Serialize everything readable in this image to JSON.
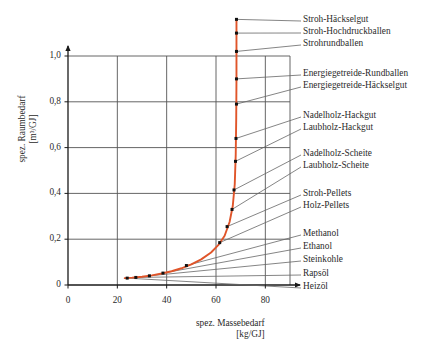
{
  "chart_data": {
    "type": "line",
    "title": "",
    "xlabel": "spez. Massebedarf",
    "xunit": "[kg/GJ]",
    "ylabel": "spez. Raumbedarf",
    "yunit": "[m³/GJ]",
    "xlim": [
      0,
      90
    ],
    "ylim": [
      0,
      1.0
    ],
    "xticks": [
      "0",
      "20",
      "40",
      "60",
      "80"
    ],
    "xtick_values": [
      0,
      20,
      40,
      60,
      80
    ],
    "yticks": [
      "0",
      "0,2",
      "0,4",
      "0,6",
      "0,8",
      "1,0"
    ],
    "ytick_values": [
      0,
      0.2,
      0.4,
      0.6,
      0.8,
      1.0
    ],
    "grid": true,
    "legend_position": "right-annotations",
    "series": [
      {
        "name": "Brennstoffkurve",
        "color": "#E0552A",
        "x": [
          23.0,
          26.0,
          30.0,
          34.0,
          38.0,
          42.0,
          46.0,
          50.0,
          54.0,
          58.0,
          61.0,
          63.5,
          65.5,
          66.8,
          67.6,
          68.0,
          68.2,
          68.3,
          68.3,
          68.3
        ],
        "y": [
          0.03,
          0.032,
          0.036,
          0.042,
          0.05,
          0.06,
          0.073,
          0.09,
          0.112,
          0.142,
          0.175,
          0.215,
          0.275,
          0.345,
          0.44,
          0.57,
          0.73,
          0.9,
          1.06,
          1.16
        ]
      }
    ],
    "data_points": [
      {
        "label": "Heizöl",
        "x": 24.0,
        "y": 0.03
      },
      {
        "label": "Rapsöl",
        "x": 27.5,
        "y": 0.033
      },
      {
        "label": "Steinkohle",
        "x": 33.0,
        "y": 0.04
      },
      {
        "label": "Ethanol",
        "x": 38.5,
        "y": 0.052
      },
      {
        "label": "Methanol",
        "x": 48.0,
        "y": 0.085
      },
      {
        "label": "Holz-Pellets",
        "x": 61.5,
        "y": 0.185
      },
      {
        "label": "Stroh-Pellets",
        "x": 64.5,
        "y": 0.255
      },
      {
        "label": "Laubholz-Scheite",
        "x": 66.5,
        "y": 0.33
      },
      {
        "label": "Nadelholz-Scheite",
        "x": 67.3,
        "y": 0.415
      },
      {
        "label": "Laubholz-Hackgut",
        "x": 67.9,
        "y": 0.54
      },
      {
        "label": "Nadelholz-Hackgut",
        "x": 68.1,
        "y": 0.64
      },
      {
        "label": "Energiegetreide-Häckselgut",
        "x": 68.3,
        "y": 0.79
      },
      {
        "label": "Energiegetreide-Rundballen",
        "x": 68.3,
        "y": 0.9
      },
      {
        "label": "Strohrundballen",
        "x": 68.3,
        "y": 1.02
      },
      {
        "label": "Stroh-Hochdruckballen",
        "x": 68.3,
        "y": 1.1
      },
      {
        "label": "Stroh-Häckselgut",
        "x": 68.3,
        "y": 1.16
      }
    ]
  },
  "annotations": {
    "groups": [
      {
        "items": [
          "Stroh-Häckselgut",
          "Stroh-Hochdruckballen",
          "Strohrundballen"
        ]
      },
      {
        "items": [
          "Energiegetreide-Rundballen",
          "Energiegetreide-Häckselgut"
        ]
      },
      {
        "items": [
          "Nadelholz-Hackgut",
          "Laubholz-Hackgut"
        ]
      },
      {
        "items": [
          "Nadelholz-Scheite",
          "Laubholz-Scheite"
        ]
      },
      {
        "items": [
          "Stroh-Pellets",
          "Holz-Pellets"
        ]
      },
      {
        "items": [
          "Methanol",
          "Ethanol",
          "Steinkohle",
          "Rapsöl",
          "Heizöl"
        ]
      }
    ],
    "labels": [
      {
        "text": "Stroh-Häckselgut",
        "top": 14
      },
      {
        "text": "Stroh-Hochdruckballen",
        "top": 26
      },
      {
        "text": "Strohrundballen",
        "top": 38
      },
      {
        "text": "Energiegetreide-Rundballen",
        "top": 68
      },
      {
        "text": "Energiegetreide-Häckselgut",
        "top": 80
      },
      {
        "text": "Nadelholz-Hackgut",
        "top": 110
      },
      {
        "text": "Laubholz-Hackgut",
        "top": 122
      },
      {
        "text": "Nadelholz-Scheite",
        "top": 148
      },
      {
        "text": "Laubholz-Scheite",
        "top": 160
      },
      {
        "text": "Stroh-Pellets",
        "top": 188
      },
      {
        "text": "Holz-Pellets",
        "top": 200
      },
      {
        "text": "Methanol",
        "top": 228
      },
      {
        "text": "Ethanol",
        "top": 241
      },
      {
        "text": "Steinkohle",
        "top": 254
      },
      {
        "text": "Rapsöl",
        "top": 268
      },
      {
        "text": "Heizöl",
        "top": 281
      }
    ]
  },
  "colors": {
    "curve": "#E0552A",
    "grid": "#555555",
    "axis": "#1a1a1a",
    "leader": "#666666",
    "background": "#ffffff"
  }
}
